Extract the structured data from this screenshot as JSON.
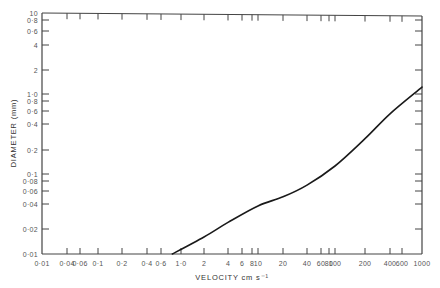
{
  "chart_data": {
    "type": "line",
    "title": "",
    "xlabel": "VELOCITY cm s⁻¹",
    "ylabel": "DIAMETER (mm)",
    "xscale": "log",
    "yscale": "log",
    "xlim": [
      0.01,
      1000
    ],
    "ylim": [
      0.01,
      10
    ],
    "grid": false,
    "legend": null,
    "x_ticks": [
      {
        "value": 0.01,
        "label": "0·01",
        "px": 42
      },
      {
        "value": 0.04,
        "label": "0·04",
        "px": 67
      },
      {
        "value": 0.06,
        "label": "0·06",
        "px": 80
      },
      {
        "value": 0.1,
        "label": "0·1",
        "px": 98
      },
      {
        "value": 0.2,
        "label": "0·2",
        "px": 122
      },
      {
        "value": 0.4,
        "label": "0·4",
        "px": 147
      },
      {
        "value": 0.6,
        "label": "0·6",
        "px": 161
      },
      {
        "value": 1.0,
        "label": "1·0",
        "px": 181
      },
      {
        "value": 2,
        "label": "2",
        "px": 204
      },
      {
        "value": 4,
        "label": "4",
        "px": 228
      },
      {
        "value": 6,
        "label": "6",
        "px": 242
      },
      {
        "value": 8,
        "label": "8",
        "px": 252
      },
      {
        "value": 10,
        "label": "10",
        "px": 258
      },
      {
        "value": 20,
        "label": "20",
        "px": 283
      },
      {
        "value": 40,
        "label": "40",
        "px": 307
      },
      {
        "value": 60,
        "label": "60",
        "px": 321
      },
      {
        "value": 80,
        "label": "80",
        "px": 329
      },
      {
        "value": 100,
        "label": "100",
        "px": 335
      },
      {
        "value": 200,
        "label": "200",
        "px": 365
      },
      {
        "value": 400,
        "label": "400",
        "px": 390
      },
      {
        "value": 600,
        "label": "600",
        "px": 402
      },
      {
        "value": 1000,
        "label": "1000",
        "px": 422
      }
    ],
    "y_ticks": [
      {
        "value": 10,
        "label": "10",
        "px": 13
      },
      {
        "value": 8,
        "label": "0·8",
        "px": 20
      },
      {
        "value": 6,
        "label": "0·6",
        "px": 31
      },
      {
        "value": 4,
        "label": "4",
        "px": 45
      },
      {
        "value": 2,
        "label": "2",
        "px": 70
      },
      {
        "value": 1.0,
        "label": "1·0",
        "px": 94
      },
      {
        "value": 0.8,
        "label": "0·8",
        "px": 101
      },
      {
        "value": 0.6,
        "label": "0·6",
        "px": 111
      },
      {
        "value": 0.4,
        "label": "0·4",
        "px": 124
      },
      {
        "value": 0.2,
        "label": "0·2",
        "px": 150
      },
      {
        "value": 0.1,
        "label": "0·1",
        "px": 174
      },
      {
        "value": 0.08,
        "label": "0·08",
        "px": 181
      },
      {
        "value": 0.06,
        "label": "0·06",
        "px": 191
      },
      {
        "value": 0.04,
        "label": "0·04",
        "px": 204
      },
      {
        "value": 0.02,
        "label": "0·02",
        "px": 229
      },
      {
        "value": 0.01,
        "label": "0·01",
        "px": 254
      }
    ],
    "series": [
      {
        "name": "threshold curve",
        "color": "#1a1a1a",
        "x": [
          0.8,
          2,
          4,
          10,
          20,
          40,
          100,
          200,
          400,
          1000
        ],
        "y": [
          0.01,
          0.016,
          0.024,
          0.038,
          0.05,
          0.071,
          0.126,
          0.27,
          0.55,
          1.22
        ]
      }
    ]
  },
  "plot_area": {
    "left": 42,
    "right": 422,
    "top": 13,
    "bottom": 254
  },
  "colors": {
    "axis": "#444444",
    "curve": "#1a1a1a",
    "background": "#ffffff"
  }
}
